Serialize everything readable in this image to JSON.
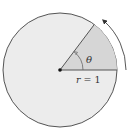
{
  "diagram": {
    "angle_label": "θ",
    "radius_label_var": "r",
    "radius_label_eq": " = 1",
    "colors": {
      "circle_fill": "#ececec",
      "sector_fill": "#d6d6d6",
      "stroke": "#555555",
      "center_dot": "#111111",
      "background": "#ffffff"
    },
    "geometry": {
      "center": [
        60,
        70
      ],
      "radius": 57,
      "sector_angle_deg": 53,
      "arrow_direction": "counterclockwise"
    }
  }
}
